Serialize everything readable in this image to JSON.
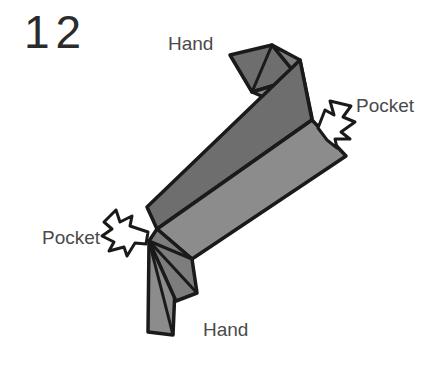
{
  "figure": {
    "step_number": "12",
    "width": 444,
    "height": 376,
    "background_color": "#ffffff"
  },
  "labels": {
    "hand_top": "Hand",
    "hand_bottom": "Hand",
    "pocket_right": "Pocket",
    "pocket_left": "Pocket"
  },
  "colors": {
    "paper_dark": "#6e6e6e",
    "paper_light": "#8c8c8c",
    "paper_mid": "#7d7d7d",
    "outline": "#1a1a1a",
    "text": "#4a4a4a",
    "step_text": "#2b2b2b",
    "arrow_fill": "#ffffff"
  },
  "diagram": {
    "type": "origami-instruction",
    "facets": [
      {
        "name": "top-flap-upper",
        "tone": "paper_dark",
        "points": "230,55 272,45 299,78 252,92"
      },
      {
        "name": "top-flap-lower",
        "tone": "paper_light",
        "points": "252,92 299,78 306,95 272,100"
      },
      {
        "name": "top-flap-right-wedge",
        "tone": "paper_mid",
        "points": "272,45 299,78 306,95 312,118 300,112"
      },
      {
        "name": "band-upper-dark",
        "tone": "paper_dark",
        "points": "300,60 312,118 156,228 148,208"
      },
      {
        "name": "band-lower-light",
        "tone": "paper_light",
        "points": "312,118 345,155 191,258 156,228"
      },
      {
        "name": "band-edge-strip",
        "tone": "paper_mid",
        "points": "156,228 191,258 176,268 150,240"
      },
      {
        "name": "bottom-flap-left",
        "tone": "paper_light",
        "points": "150,240 174,262 171,334 148,331"
      },
      {
        "name": "bottom-flap-right",
        "tone": "paper_mid",
        "points": "150,240 191,258 196,292 174,300"
      }
    ],
    "arrows": [
      {
        "name": "pocket-arrow-right",
        "direction": "down-left",
        "style": "hollow-outline-zigzag-tail",
        "tip_x": 318,
        "tip_y": 128
      },
      {
        "name": "pocket-arrow-left",
        "direction": "right",
        "style": "hollow-outline-zigzag-tail",
        "tip_x": 148,
        "tip_y": 232
      }
    ]
  }
}
